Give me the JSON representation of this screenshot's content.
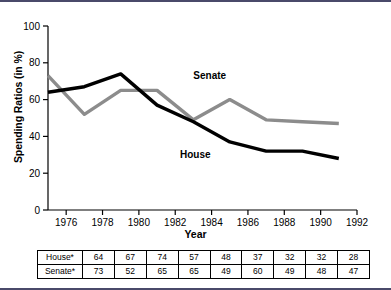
{
  "chart_data": {
    "type": "line",
    "title": "",
    "xlabel": "Year",
    "ylabel": "Spending Ratios (in %)",
    "x": [
      1975,
      1977,
      1979,
      1981,
      1983,
      1985,
      1987,
      1989,
      1991
    ],
    "xlim": [
      1975,
      1992
    ],
    "ylim": [
      0,
      100
    ],
    "xticks": [
      1976,
      1978,
      1980,
      1982,
      1984,
      1986,
      1988,
      1990,
      1992
    ],
    "yticks": [
      0,
      20,
      40,
      60,
      80,
      100
    ],
    "grid": false,
    "legend_position": "inline-annotation",
    "series": [
      {
        "name": "House",
        "color": "#000000",
        "values": [
          64,
          67,
          74,
          57,
          48,
          37,
          32,
          32,
          28
        ],
        "label_x": 1983.1,
        "label_y": 28
      },
      {
        "name": "Senate",
        "color": "#8c8c8c",
        "values": [
          73,
          52,
          65,
          65,
          49,
          60,
          49,
          48,
          47
        ],
        "label_x": 1983.9,
        "label_y": 71
      }
    ]
  },
  "table": {
    "rows": [
      {
        "label": "House*",
        "values": [
          "64",
          "67",
          "74",
          "57",
          "48",
          "37",
          "32",
          "32",
          "28"
        ]
      },
      {
        "label": "Senate*",
        "values": [
          "73",
          "52",
          "65",
          "65",
          "49",
          "60",
          "49",
          "48",
          "47"
        ]
      }
    ]
  },
  "axis": {
    "y_title": "Spending Ratios (in %)",
    "x_title": "Year",
    "yticks": [
      "0",
      "20",
      "40",
      "60",
      "80",
      "100"
    ],
    "xticks": [
      "1976",
      "1978",
      "1980",
      "1982",
      "1984",
      "1986",
      "1988",
      "1990",
      "1992"
    ]
  }
}
